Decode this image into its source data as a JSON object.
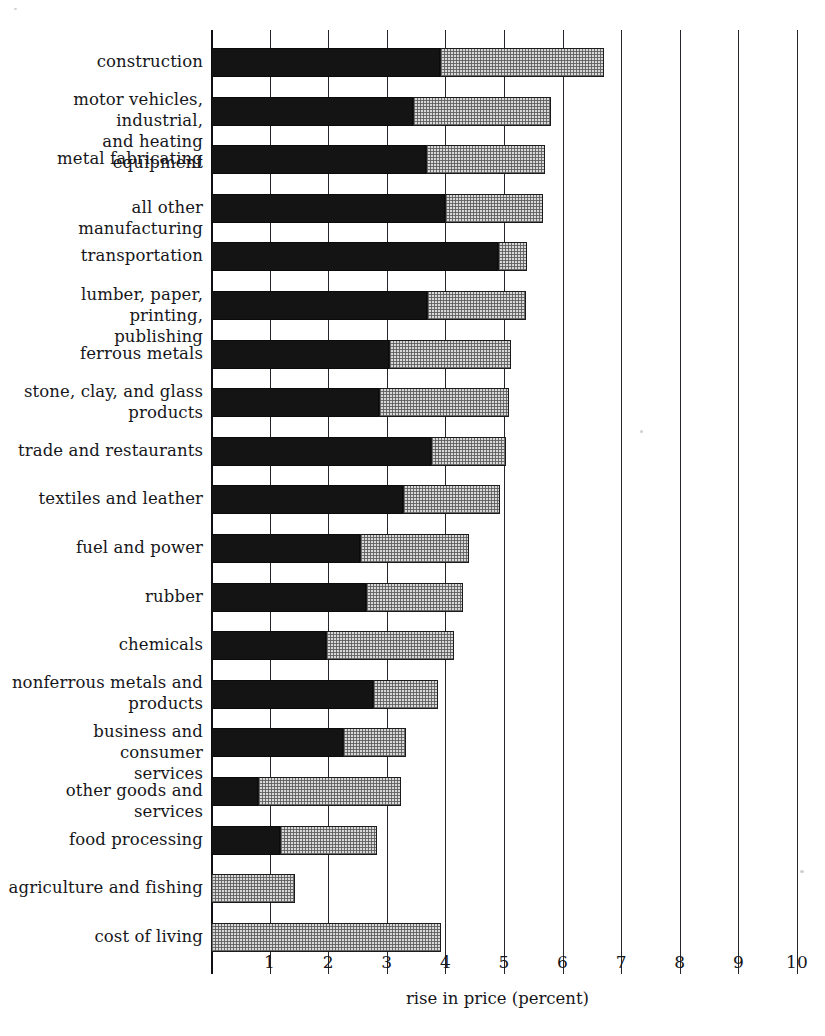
{
  "chart_data": {
    "type": "bar",
    "orientation": "horizontal",
    "stacked": true,
    "title": "",
    "xlabel": "rise in price (percent)",
    "ylabel": "",
    "xlim": [
      0,
      10
    ],
    "xticks": [
      "1",
      "2",
      "3",
      "4",
      "5",
      "6",
      "7",
      "8",
      "9",
      "10"
    ],
    "xtick_values": [
      1,
      2,
      3,
      4,
      5,
      6,
      7,
      8,
      9,
      10
    ],
    "grid": true,
    "legend": "none",
    "series": [
      {
        "name": "dark-segment",
        "color": "#141414"
      },
      {
        "name": "light-stipple-segment",
        "color": "#d8d8d8"
      }
    ],
    "categories": [
      "construction",
      "motor vehicles, industrial,\nand heating equipment",
      "metal fabricating",
      "all other manufacturing",
      "transportation",
      "lumber, paper, printing,\npublishing",
      "ferrous metals",
      "stone, clay, and glass\nproducts",
      "trade and restaurants",
      "textiles and leather",
      "fuel and power",
      "rubber",
      "chemicals",
      "nonferrous metals and\nproducts",
      "business and consumer\nservices",
      "other goods and services",
      "food processing",
      "agriculture and fishing",
      "cost of living"
    ],
    "rows": [
      {
        "label": "construction",
        "label_lines": [
          "construction"
        ],
        "dark": 3.9,
        "total": 6.7
      },
      {
        "label": "motor vehicles, industrial, and heating equipment",
        "label_lines": [
          "motor vehicles, industrial,",
          "and heating equipment"
        ],
        "dark": 3.45,
        "total": 5.8
      },
      {
        "label": "metal fabricating",
        "label_lines": [
          "metal fabricating"
        ],
        "dark": 3.67,
        "total": 5.7
      },
      {
        "label": "all other manufacturing",
        "label_lines": [
          "all other manufacturing"
        ],
        "dark": 4.0,
        "total": 5.67
      },
      {
        "label": "transportation",
        "label_lines": [
          "transportation"
        ],
        "dark": 4.9,
        "total": 5.4
      },
      {
        "label": "lumber, paper, printing, publishing",
        "label_lines": [
          "lumber, paper, printing,",
          "publishing"
        ],
        "dark": 3.68,
        "total": 5.38
      },
      {
        "label": "ferrous metals",
        "label_lines": [
          "ferrous metals"
        ],
        "dark": 3.03,
        "total": 5.12
      },
      {
        "label": "stone, clay, and glass products",
        "label_lines": [
          "stone, clay,  and glass",
          "products"
        ],
        "dark": 2.87,
        "total": 5.08
      },
      {
        "label": "trade and restaurants",
        "label_lines": [
          "trade and restaurants"
        ],
        "dark": 3.76,
        "total": 5.03
      },
      {
        "label": "textiles and leather",
        "label_lines": [
          "textiles and leather"
        ],
        "dark": 3.27,
        "total": 4.94
      },
      {
        "label": "fuel and power",
        "label_lines": [
          "fuel and power"
        ],
        "dark": 2.54,
        "total": 4.4
      },
      {
        "label": "rubber",
        "label_lines": [
          "rubber"
        ],
        "dark": 2.64,
        "total": 4.3
      },
      {
        "label": "chemicals",
        "label_lines": [
          "chemicals"
        ],
        "dark": 1.96,
        "total": 4.14
      },
      {
        "label": "nonferrous metals and products",
        "label_lines": [
          "nonferrous metals  and",
          "products"
        ],
        "dark": 2.76,
        "total": 3.88
      },
      {
        "label": "business and consumer services",
        "label_lines": [
          "business and consumer",
          "services"
        ],
        "dark": 2.26,
        "total": 3.33
      },
      {
        "label": "other goods and services",
        "label_lines": [
          "other goods and services"
        ],
        "dark": 0.81,
        "total": 3.25
      },
      {
        "label": "food processing",
        "label_lines": [
          "food processing"
        ],
        "dark": 1.18,
        "total": 2.83
      },
      {
        "label": "agriculture and fishing",
        "label_lines": [
          "agriculture and fishing"
        ],
        "dark": 0.0,
        "total": 1.43
      },
      {
        "label": "cost of living",
        "label_lines": [
          "cost of living"
        ],
        "dark": 0.0,
        "total": 3.92
      }
    ]
  }
}
